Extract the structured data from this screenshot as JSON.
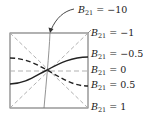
{
  "diagram": {
    "variable": "B",
    "subscript": "21",
    "labels": [
      {
        "id": "m10",
        "value": "= −10",
        "x": 78,
        "y": 6
      },
      {
        "id": "m1",
        "value": "= −1",
        "x": 89,
        "y": 28
      },
      {
        "id": "m05",
        "value": "= −0.5",
        "x": 89,
        "y": 49
      },
      {
        "id": "z",
        "value": "= 0",
        "x": 89,
        "y": 66
      },
      {
        "id": "p05",
        "value": "= 0.5",
        "x": 89,
        "y": 81
      },
      {
        "id": "p1",
        "value": "= 1",
        "x": 89,
        "y": 103
      }
    ],
    "colors": {
      "frame": "#555555",
      "solid_curve": "#222222",
      "light_dash": "#a8a8a8"
    }
  }
}
